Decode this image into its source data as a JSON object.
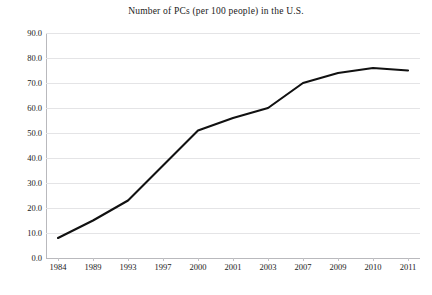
{
  "chart_data": {
    "type": "line",
    "title": "Number of PCs (per 100 people) in the U.S.",
    "xlabel": "",
    "ylabel": "",
    "categories": [
      "1984",
      "1989",
      "1993",
      "1997",
      "2000",
      "2001",
      "2003",
      "2007",
      "2009",
      "2010",
      "2011"
    ],
    "values": [
      8.0,
      15.0,
      23.0,
      37.0,
      51.0,
      56.0,
      60.0,
      70.0,
      74.0,
      76.0,
      75.0
    ],
    "series": [
      {
        "name": "PCs per 100 people",
        "values": [
          8.0,
          15.0,
          23.0,
          37.0,
          51.0,
          56.0,
          60.0,
          70.0,
          74.0,
          76.0,
          75.0
        ]
      }
    ],
    "ylim": [
      0.0,
      90.0
    ],
    "ytick_labels": [
      "90.0",
      "80.0",
      "70.0",
      "60.0",
      "50.0",
      "40.0",
      "30.0",
      "20.0",
      "10.0",
      "0.0"
    ],
    "ytick_values": [
      90.0,
      80.0,
      70.0,
      60.0,
      50.0,
      40.0,
      30.0,
      20.0,
      10.0,
      0.0
    ],
    "grid": true,
    "legend": false,
    "legend_position": "none",
    "line_color": "#111111",
    "grid_color": "#e4e4e6",
    "axis_color": "#b9b9bd",
    "background_color": "#ffffff",
    "markers": false
  }
}
